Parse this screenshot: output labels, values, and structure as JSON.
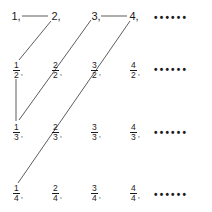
{
  "diagram": {
    "title": "",
    "rows": [
      {
        "cells": [
          {
            "type": "int",
            "text": "1,"
          },
          {
            "type": "int",
            "text": "2,"
          },
          {
            "type": "int",
            "text": "3,"
          },
          {
            "type": "int",
            "text": "4,"
          }
        ],
        "ellipsis": "••••••"
      },
      {
        "cells": [
          {
            "type": "frac",
            "num": "1",
            "den": "2",
            "sep": ","
          },
          {
            "type": "frac",
            "num": "2",
            "den": "2",
            "sep": ","
          },
          {
            "type": "frac",
            "num": "3",
            "den": "2",
            "sep": ","
          },
          {
            "type": "frac",
            "num": "4",
            "den": "2",
            "sep": ","
          }
        ],
        "ellipsis": "••••••"
      },
      {
        "cells": [
          {
            "type": "frac",
            "num": "1",
            "den": "3",
            "sep": ","
          },
          {
            "type": "frac",
            "num": "2",
            "den": "3",
            "sep": ","
          },
          {
            "type": "frac",
            "num": "3",
            "den": "3",
            "sep": ","
          },
          {
            "type": "frac",
            "num": "4",
            "den": "3",
            "sep": ","
          }
        ],
        "ellipsis": "••••••"
      },
      {
        "cells": [
          {
            "type": "frac",
            "num": "1",
            "den": "4",
            "sep": ","
          },
          {
            "type": "frac",
            "num": "2",
            "den": "4",
            "sep": ","
          },
          {
            "type": "frac",
            "num": "3",
            "den": "4",
            "sep": ","
          },
          {
            "type": "frac",
            "num": "4",
            "den": "4",
            "sep": ","
          }
        ],
        "ellipsis": "••••••"
      }
    ],
    "line_color": "#333333"
  }
}
